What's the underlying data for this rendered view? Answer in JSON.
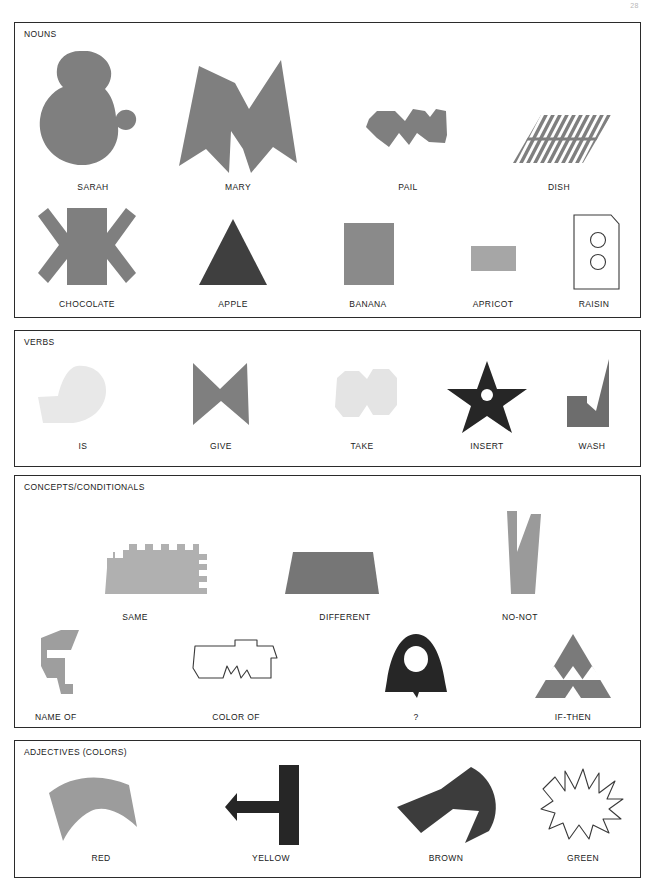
{
  "page": {
    "page_number": "28",
    "background": "#ffffff",
    "border_color": "#2b2b2b"
  },
  "palette": {
    "mid_gray": "#7f7f7f",
    "light_gray": "#a9a9a9",
    "pale_gray": "#e8e8e8",
    "dark_gray": "#5e5e5e",
    "near_black": "#262626",
    "outline": "#3a3a3a"
  },
  "sections": [
    {
      "id": "nouns",
      "title": "NOUNS",
      "rows": [
        {
          "items": [
            {
              "label": "SARAH",
              "icon": "sarah-blob-shape",
              "fill": "#7f7f7f"
            },
            {
              "label": "MARY",
              "icon": "mary-m-shape",
              "fill": "#7f7f7f"
            },
            {
              "label": "PAIL",
              "icon": "pail-zigzag-shape",
              "fill": "#7f7f7f"
            },
            {
              "label": "DISH",
              "icon": "dish-striped-parallelogram-shape",
              "fill": "#7f7f7f"
            }
          ]
        },
        {
          "items": [
            {
              "label": "CHOCOLATE",
              "icon": "chocolate-asterisk-shape",
              "fill": "#7f7f7f"
            },
            {
              "label": "APPLE",
              "icon": "apple-triangle-shape",
              "fill": "#3f3f3f"
            },
            {
              "label": "BANANA",
              "icon": "banana-square-shape",
              "fill": "#8a8a8a"
            },
            {
              "label": "APRICOT",
              "icon": "apricot-rectangle-shape",
              "fill": "#a6a6a6"
            },
            {
              "label": "RAISIN",
              "icon": "raisin-outlined-card-shape",
              "fill": "#ffffff"
            }
          ]
        }
      ]
    },
    {
      "id": "verbs",
      "title": "VERBS",
      "rows": [
        {
          "items": [
            {
              "label": "IS",
              "icon": "is-comma-blob-shape",
              "fill": "#e8e8e8"
            },
            {
              "label": "GIVE",
              "icon": "give-bowtie-shape",
              "fill": "#7f7f7f"
            },
            {
              "label": "TAKE",
              "icon": "take-double-hexagon-shape",
              "fill": "#e4e4e4"
            },
            {
              "label": "INSERT",
              "icon": "insert-star-shape",
              "fill": "#262626"
            },
            {
              "label": "WASH",
              "icon": "wash-notched-triangle-shape",
              "fill": "#6d6d6d"
            }
          ]
        }
      ]
    },
    {
      "id": "concepts",
      "title": "CONCEPTS/CONDITIONALS",
      "rows": [
        {
          "items": [
            {
              "label": "SAME",
              "icon": "same-comb-shape",
              "fill": "#b0b0b0"
            },
            {
              "label": "DIFFERENT",
              "icon": "different-trapezoid-shape",
              "fill": "#767676"
            },
            {
              "label": "NO-NOT",
              "icon": "no-not-forked-shape",
              "fill": "#9a9a9a"
            }
          ]
        },
        {
          "items": [
            {
              "label": "NAME OF",
              "icon": "name-of-angular-shape",
              "fill": "#9e9e9e"
            },
            {
              "label": "COLOR OF",
              "icon": "color-of-outline-shape",
              "fill": "#ffffff"
            },
            {
              "label": "?",
              "icon": "question-bell-shape",
              "fill": "#262626"
            },
            {
              "label": "IF-THEN",
              "icon": "if-then-sierpinski-triangle-shape",
              "fill": "#7a7a7a"
            }
          ]
        }
      ]
    },
    {
      "id": "adjectives",
      "title": "ADJECTIVES (COLORS)",
      "rows": [
        {
          "items": [
            {
              "label": "RED",
              "icon": "red-curved-wing-shape",
              "fill": "#9c9c9c"
            },
            {
              "label": "YELLOW",
              "icon": "yellow-tee-shape",
              "fill": "#262626"
            },
            {
              "label": "BROWN",
              "icon": "brown-arrow-crescent-shape",
              "fill": "#3c3c3c"
            },
            {
              "label": "GREEN",
              "icon": "green-starburst-outline-shape",
              "fill": "#ffffff"
            }
          ]
        }
      ]
    }
  ]
}
